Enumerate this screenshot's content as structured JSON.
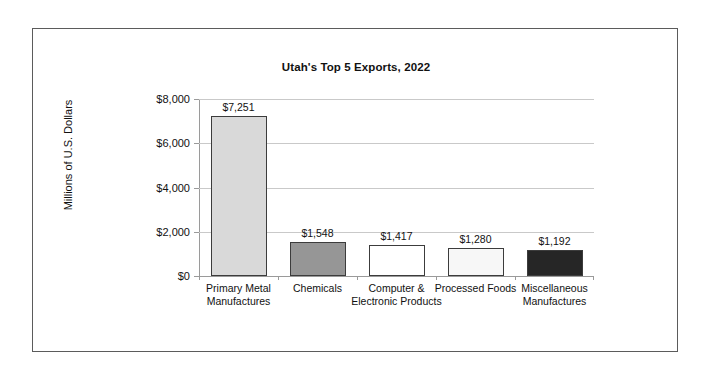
{
  "chart_data": {
    "type": "bar",
    "title": "Utah's Top 5 Exports, 2022",
    "xlabel": "",
    "ylabel": "Millions of U.S. Dollars",
    "ylim": [
      0,
      8000
    ],
    "yticks": [
      0,
      2000,
      4000,
      6000,
      8000
    ],
    "ytick_labels": [
      "$0",
      "$2,000",
      "$4,000",
      "$6,000",
      "$8,000"
    ],
    "grid": true,
    "legend": "none",
    "categories": [
      "Primary Metal Manufactures",
      "Chemicals",
      "Computer & Electronic Products",
      "Processed Foods",
      "Miscellaneous Manufactures"
    ],
    "values": [
      7251,
      1548,
      1417,
      1280,
      1192
    ],
    "value_labels": [
      "$7,251",
      "$1,548",
      "$1,417",
      "$1,280",
      "$1,192"
    ],
    "bar_colors": [
      "#d9d9d9",
      "#969696",
      "#ffffff",
      "#f7f7f7",
      "#262626"
    ],
    "bar_edge_color": "#3c3c3c",
    "grid_color": "#c9c9c9",
    "axis_color": "#9a9a9a"
  },
  "chart": {
    "title": "Utah's Top 5 Exports, 2022",
    "ylabel": "Millions of U.S. Dollars",
    "yticks": [
      {
        "label": "$8,000"
      },
      {
        "label": "$6,000"
      },
      {
        "label": "$4,000"
      },
      {
        "label": "$2,000"
      },
      {
        "label": "$0"
      }
    ],
    "bars": [
      {
        "category": "Primary Metal Manufactures",
        "value_label": "$7,251"
      },
      {
        "category": "Chemicals",
        "value_label": "$1,548"
      },
      {
        "category": "Computer & Electronic Products",
        "value_label": "$1,417"
      },
      {
        "category": "Processed Foods",
        "value_label": "$1,280"
      },
      {
        "category": "Miscellaneous Manufactures",
        "value_label": "$1,192"
      }
    ]
  }
}
